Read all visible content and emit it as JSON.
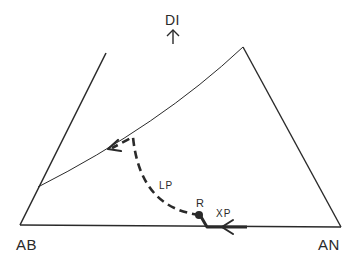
{
  "diagram": {
    "type": "ternary-phase-diagram",
    "vertices": {
      "bottom_left": "AB",
      "bottom_right": "AN",
      "top": "DI"
    },
    "top_direction_arrow": "up-arrow-icon",
    "paths": {
      "liquid_path": {
        "label": "LP",
        "style": "dashed"
      },
      "crystal_path": {
        "label": "XP",
        "style": "solid-thick"
      }
    },
    "points": {
      "reaction_point": {
        "label": "R"
      }
    },
    "colors": {
      "ink": "#2a2a2a",
      "background": "#ffffff"
    }
  }
}
